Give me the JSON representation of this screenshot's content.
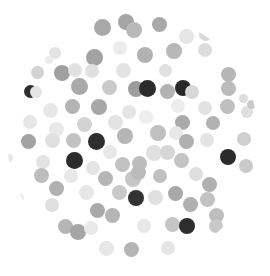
{
  "scene": {
    "title": "grayscale-dot-scatter",
    "width": 270,
    "height": 276,
    "background_color": "#ffffff",
    "clip_shape": "circle",
    "clip": {
      "cx": 133,
      "cy": 139,
      "r": 126
    }
  },
  "chart_data": {
    "type": "scatter",
    "title": "",
    "subtitle": "",
    "xlabel": "",
    "ylabel": "",
    "xlim": [
      0,
      270
    ],
    "ylim": [
      0,
      276
    ],
    "grid": false,
    "legend": null,
    "annotations": [],
    "marker": "circle",
    "colormap": "grays",
    "value_range": {
      "darkest": "#262626",
      "lightest": "#efefef"
    },
    "points": [
      {
        "x": 102,
        "y": 27,
        "r": 8.5,
        "c": "#a8a8a8"
      },
      {
        "x": 126,
        "y": 22,
        "r": 8.0,
        "c": "#a5a5a5"
      },
      {
        "x": 134,
        "y": 30,
        "r": 8.0,
        "c": "#b9b9b9"
      },
      {
        "x": 159,
        "y": 24,
        "r": 7.5,
        "c": "#a9a9a9"
      },
      {
        "x": 186,
        "y": 36,
        "r": 7.5,
        "c": "#e6e6e6"
      },
      {
        "x": 205,
        "y": 34,
        "r": 6.5,
        "c": "#d9d9d9"
      },
      {
        "x": 55,
        "y": 53,
        "r": 6.0,
        "c": "#e4e4e4"
      },
      {
        "x": 94,
        "y": 57,
        "r": 8.5,
        "c": "#a3a3a3"
      },
      {
        "x": 120,
        "y": 48,
        "r": 7.0,
        "c": "#ededed"
      },
      {
        "x": 145,
        "y": 55,
        "r": 8.0,
        "c": "#b2b2b2"
      },
      {
        "x": 174,
        "y": 51,
        "r": 8.0,
        "c": "#b8b8b8"
      },
      {
        "x": 205,
        "y": 50,
        "r": 7.0,
        "c": "#dcdcdc"
      },
      {
        "x": 220,
        "y": 36,
        "r": 6.0,
        "c": "#c9c9c9"
      },
      {
        "x": 37,
        "y": 72,
        "r": 6.5,
        "c": "#d2d2d2"
      },
      {
        "x": 62,
        "y": 73,
        "r": 8.0,
        "c": "#a0a0a0"
      },
      {
        "x": 75,
        "y": 70,
        "r": 7.0,
        "c": "#e2e2e2"
      },
      {
        "x": 92,
        "y": 71,
        "r": 7.0,
        "c": "#e0e0e0"
      },
      {
        "x": 123,
        "y": 70,
        "r": 7.5,
        "c": "#e3e3e3"
      },
      {
        "x": 165,
        "y": 70,
        "r": 6.5,
        "c": "#e1e1e1"
      },
      {
        "x": 228,
        "y": 74,
        "r": 7.5,
        "c": "#b6b6b6"
      },
      {
        "x": 246,
        "y": 68,
        "r": 6.0,
        "c": "#ebebeb"
      },
      {
        "x": 30,
        "y": 91,
        "r": 6.5,
        "c": "#2e2e2e"
      },
      {
        "x": 36,
        "y": 92,
        "r": 6.0,
        "c": "#e4e4e4"
      },
      {
        "x": 79,
        "y": 86,
        "r": 8.5,
        "c": "#a9a9a9"
      },
      {
        "x": 109,
        "y": 87,
        "r": 7.5,
        "c": "#c9c9c9"
      },
      {
        "x": 136,
        "y": 89,
        "r": 8.0,
        "c": "#9c9c9c"
      },
      {
        "x": 147,
        "y": 88,
        "r": 8.5,
        "c": "#2c2c2c"
      },
      {
        "x": 167,
        "y": 91,
        "r": 7.5,
        "c": "#b2b2b2"
      },
      {
        "x": 183,
        "y": 88,
        "r": 8.0,
        "c": "#292929"
      },
      {
        "x": 192,
        "y": 92,
        "r": 7.0,
        "c": "#d8d8d8"
      },
      {
        "x": 228,
        "y": 88,
        "r": 7.5,
        "c": "#bbbbbb"
      },
      {
        "x": 50,
        "y": 110,
        "r": 7.5,
        "c": "#e8e8e8"
      },
      {
        "x": 72,
        "y": 106,
        "r": 7.5,
        "c": "#b4b4b4"
      },
      {
        "x": 99,
        "y": 107,
        "r": 8.0,
        "c": "#a7a7a7"
      },
      {
        "x": 129,
        "y": 112,
        "r": 7.0,
        "c": "#e5e5e5"
      },
      {
        "x": 146,
        "y": 117,
        "r": 7.0,
        "c": "#ededed"
      },
      {
        "x": 178,
        "y": 106,
        "r": 7.0,
        "c": "#ededed"
      },
      {
        "x": 205,
        "y": 108,
        "r": 7.0,
        "c": "#e2e2e2"
      },
      {
        "x": 227,
        "y": 106,
        "r": 7.5,
        "c": "#bfbfbf"
      },
      {
        "x": 247,
        "y": 112,
        "r": 6.0,
        "c": "#e0e0e0"
      },
      {
        "x": 30,
        "y": 122,
        "r": 7.0,
        "c": "#e6e6e6"
      },
      {
        "x": 56,
        "y": 129,
        "r": 7.5,
        "c": "#e9e9e9"
      },
      {
        "x": 84,
        "y": 124,
        "r": 7.5,
        "c": "#d3d3d3"
      },
      {
        "x": 115,
        "y": 122,
        "r": 7.5,
        "c": "#e3e3e3"
      },
      {
        "x": 182,
        "y": 122,
        "r": 7.5,
        "c": "#aaaaaa"
      },
      {
        "x": 213,
        "y": 123,
        "r": 7.0,
        "c": "#b1b1b1"
      },
      {
        "x": 28,
        "y": 141,
        "r": 7.5,
        "c": "#a2a2a2"
      },
      {
        "x": 52,
        "y": 140,
        "r": 7.5,
        "c": "#e0e0e0"
      },
      {
        "x": 73,
        "y": 140,
        "r": 7.5,
        "c": "#c2c2c2"
      },
      {
        "x": 96,
        "y": 141,
        "r": 8.5,
        "c": "#2e2e2e"
      },
      {
        "x": 125,
        "y": 136,
        "r": 8.0,
        "c": "#b6b6b6"
      },
      {
        "x": 158,
        "y": 133,
        "r": 8.0,
        "c": "#c0c0c0"
      },
      {
        "x": 176,
        "y": 133,
        "r": 7.0,
        "c": "#e8e8e8"
      },
      {
        "x": 186,
        "y": 141,
        "r": 7.5,
        "c": "#b0b0b0"
      },
      {
        "x": 207,
        "y": 140,
        "r": 7.0,
        "c": "#e3e3e3"
      },
      {
        "x": 244,
        "y": 139,
        "r": 7.0,
        "c": "#cfcfcf"
      },
      {
        "x": 110,
        "y": 152,
        "r": 7.0,
        "c": "#e8e8e8"
      },
      {
        "x": 154,
        "y": 153,
        "r": 8.0,
        "c": "#e0e0e0"
      },
      {
        "x": 167,
        "y": 152,
        "r": 7.5,
        "c": "#d6d6d6"
      },
      {
        "x": 43,
        "y": 162,
        "r": 7.0,
        "c": "#e3e3e3"
      },
      {
        "x": 74,
        "y": 160,
        "r": 8.5,
        "c": "#2b2b2b"
      },
      {
        "x": 93,
        "y": 168,
        "r": 7.0,
        "c": "#e4e4e4"
      },
      {
        "x": 122,
        "y": 164,
        "r": 7.5,
        "c": "#c2c2c2"
      },
      {
        "x": 139,
        "y": 163,
        "r": 7.5,
        "c": "#bdbdbd"
      },
      {
        "x": 181,
        "y": 160,
        "r": 7.5,
        "c": "#c4c4c4"
      },
      {
        "x": 228,
        "y": 157,
        "r": 8.0,
        "c": "#2b2b2b"
      },
      {
        "x": 246,
        "y": 166,
        "r": 7.0,
        "c": "#cbcbcb"
      },
      {
        "x": 41,
        "y": 175,
        "r": 7.5,
        "c": "#bdbdbd"
      },
      {
        "x": 71,
        "y": 176,
        "r": 7.0,
        "c": "#e8e8e8"
      },
      {
        "x": 105,
        "y": 178,
        "r": 7.5,
        "c": "#b6b6b6"
      },
      {
        "x": 133,
        "y": 179,
        "r": 8.0,
        "c": "#c6c6c6"
      },
      {
        "x": 138,
        "y": 172,
        "r": 7.5,
        "c": "#bbbbbb"
      },
      {
        "x": 160,
        "y": 176,
        "r": 7.0,
        "c": "#c0c0c0"
      },
      {
        "x": 196,
        "y": 174,
        "r": 7.0,
        "c": "#dedede"
      },
      {
        "x": 209,
        "y": 184,
        "r": 7.5,
        "c": "#b0b0b0"
      },
      {
        "x": 56,
        "y": 188,
        "r": 7.5,
        "c": "#b1b1b1"
      },
      {
        "x": 86,
        "y": 192,
        "r": 7.5,
        "c": "#e6e6e6"
      },
      {
        "x": 119,
        "y": 192,
        "r": 7.5,
        "c": "#c9c9c9"
      },
      {
        "x": 136,
        "y": 198,
        "r": 8.0,
        "c": "#323232"
      },
      {
        "x": 155,
        "y": 197,
        "r": 7.5,
        "c": "#e0e0e0"
      },
      {
        "x": 175,
        "y": 193,
        "r": 7.5,
        "c": "#a8a8a8"
      },
      {
        "x": 207,
        "y": 199,
        "r": 7.5,
        "c": "#c2c2c2"
      },
      {
        "x": 52,
        "y": 205,
        "r": 7.0,
        "c": "#e0e0e0"
      },
      {
        "x": 97,
        "y": 210,
        "r": 7.5,
        "c": "#a9a9a9"
      },
      {
        "x": 112,
        "y": 215,
        "r": 7.5,
        "c": "#b5b5b5"
      },
      {
        "x": 190,
        "y": 204,
        "r": 7.5,
        "c": "#b0b0b0"
      },
      {
        "x": 216,
        "y": 215,
        "r": 7.5,
        "c": "#bebebe"
      },
      {
        "x": 65,
        "y": 226,
        "r": 7.5,
        "c": "#b6b6b6"
      },
      {
        "x": 78,
        "y": 232,
        "r": 8.0,
        "c": "#a5a5a5"
      },
      {
        "x": 91,
        "y": 228,
        "r": 7.0,
        "c": "#e9e9e9"
      },
      {
        "x": 144,
        "y": 226,
        "r": 7.0,
        "c": "#e8e8e8"
      },
      {
        "x": 172,
        "y": 224,
        "r": 7.5,
        "c": "#c5c5c5"
      },
      {
        "x": 187,
        "y": 226,
        "r": 8.0,
        "c": "#2d2d2d"
      },
      {
        "x": 216,
        "y": 226,
        "r": 7.0,
        "c": "#c8c8c8"
      },
      {
        "x": 106,
        "y": 248,
        "r": 7.5,
        "c": "#e7e7e7"
      },
      {
        "x": 131,
        "y": 249,
        "r": 7.5,
        "c": "#b5b5b5"
      },
      {
        "x": 168,
        "y": 248,
        "r": 7.0,
        "c": "#e6e6e6"
      },
      {
        "x": 49,
        "y": 60,
        "r": 4.0,
        "c": "#ececec"
      },
      {
        "x": 9,
        "y": 158,
        "r": 4.0,
        "c": "#e8e8e8"
      },
      {
        "x": 243,
        "y": 98,
        "r": 4.5,
        "c": "#dcdcdc"
      },
      {
        "x": 251,
        "y": 104,
        "r": 4.5,
        "c": "#cacaca"
      },
      {
        "x": 20,
        "y": 198,
        "r": 4.0,
        "c": "#ebebeb"
      }
    ]
  }
}
